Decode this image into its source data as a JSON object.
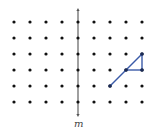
{
  "diagram": {
    "type": "dot-grid-reflection",
    "grid": {
      "columns": [
        14,
        30,
        46,
        62,
        78,
        94,
        110,
        126,
        142
      ],
      "rows": [
        22,
        38,
        54,
        70,
        86,
        102
      ],
      "dot_color": "#111111",
      "dot_radius": 1.6
    },
    "line_of_reflection": {
      "label": "m",
      "x": 78,
      "y_top": 8,
      "y_bottom": 117,
      "color": "#888888"
    },
    "figure": {
      "color": "#3b5ba8",
      "segments": [
        {
          "from": [
            110,
            86
          ],
          "to": [
            142,
            54
          ]
        },
        {
          "from": [
            126,
            70
          ],
          "to": [
            142,
            70
          ]
        },
        {
          "from": [
            142,
            70
          ],
          "to": [
            142,
            54
          ]
        }
      ],
      "vertices": [
        [
          110,
          86
        ],
        [
          126,
          70
        ],
        [
          142,
          70
        ],
        [
          142,
          54
        ]
      ]
    }
  }
}
